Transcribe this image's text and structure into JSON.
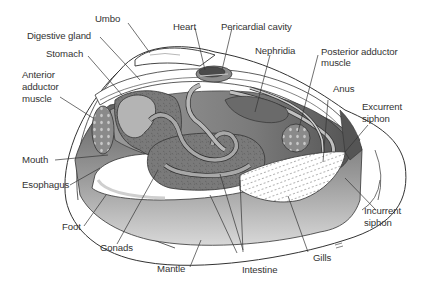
{
  "labels": {
    "umbo": "Umbo",
    "heart": "Heart",
    "pericardial_cavity": "Pericardial cavity",
    "digestive_gland": "Digestive gland",
    "nephridia": "Nephridia",
    "posterior_adductor_muscle_1": "Posterior adductor",
    "posterior_adductor_muscle_2": "muscle",
    "stomach": "Stomach",
    "anterior_adductor_muscle_1": "Anterior",
    "anterior_adductor_muscle_2": "adductor",
    "anterior_adductor_muscle_3": "muscle",
    "anus": "Anus",
    "excurrent_siphon_1": "Excurrent",
    "excurrent_siphon_2": "siphon",
    "mouth": "Mouth",
    "esophagus": "Esophagus",
    "foot": "Foot",
    "incurrent_siphon_1": "Incurrent",
    "incurrent_siphon_2": "siphon",
    "gonads": "Gonads",
    "gills": "Gills",
    "mantle": "Mantle",
    "intestine": "Intestine"
  },
  "colors": {
    "line": "#333333",
    "dark_organ": "#6e6e6e",
    "mid_organ": "#8c8c8c",
    "light_organ": "#b4b4b4",
    "shell_fill": "#ffffff",
    "mantle_fill": "#c8c8c8",
    "heart_fill": "#4a4a4a"
  }
}
